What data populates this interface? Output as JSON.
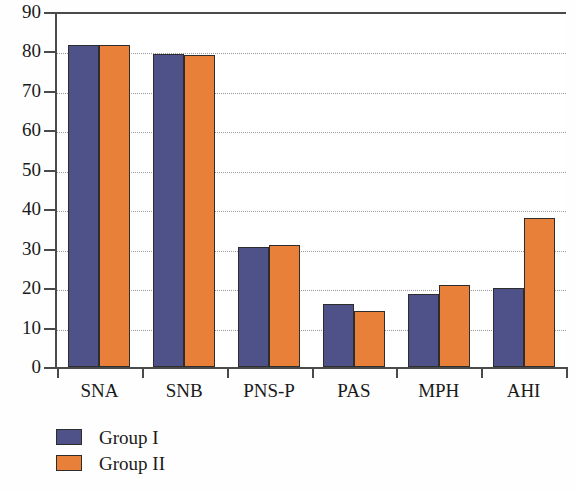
{
  "chart_data": {
    "type": "bar",
    "title": "",
    "xlabel": "",
    "ylabel": "",
    "categories": [
      "SNA",
      "SNB",
      "PNS-P",
      "PAS",
      "MPH",
      "AHI"
    ],
    "series": [
      {
        "name": "Group I",
        "color": "#4e5289",
        "values": [
          81.7,
          79.3,
          30.5,
          16.0,
          18.5,
          20.0
        ]
      },
      {
        "name": "Group II",
        "color": "#e9803a",
        "values": [
          81.7,
          79.2,
          31.0,
          14.2,
          20.7,
          37.7
        ]
      }
    ],
    "ylim": [
      0,
      90
    ],
    "ytick_values": [
      0,
      10,
      20,
      30,
      40,
      50,
      60,
      70,
      80,
      90
    ],
    "ytick_labels": [
      "0",
      "10",
      "20",
      "30",
      "40",
      "50",
      "60",
      "70",
      "80",
      "90"
    ],
    "grid": "horizontal-dotted",
    "legend_position": "bottom-left",
    "bar_border_color": "#2d2d2d",
    "plot_background": "#ffffff"
  },
  "legend": {
    "items": [
      {
        "label": "Group I",
        "swatch": "#4e5289"
      },
      {
        "label": "Group II",
        "swatch": "#e9803a"
      }
    ]
  }
}
